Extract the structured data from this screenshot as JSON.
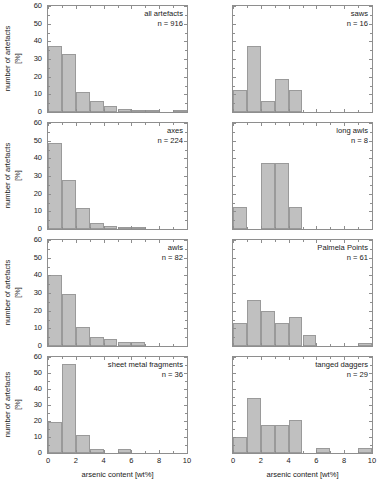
{
  "figure": {
    "width": 382,
    "height": 494,
    "bar_fill": "#c0c0c0",
    "bar_stroke": "#9a9a9a",
    "axis_color": "#8e8e8e",
    "xlabel": "arsenic content [wt%]",
    "ylabel": "number of artefacts",
    "ylabel_units": "[%]",
    "xticks": [
      "0",
      "2",
      "4",
      "6",
      "8",
      "10"
    ],
    "yticks_main": [
      "0",
      "10",
      "20",
      "30",
      "40",
      "50",
      "60"
    ]
  },
  "chart_data": [
    {
      "type": "bar",
      "panel": "top-left",
      "title": "all artefacts",
      "n_label": "n = 916",
      "n": 916,
      "xlabel": "arsenic content [wt%]",
      "ylabel": "number of artefacts [%]",
      "xlim": [
        0,
        10
      ],
      "ylim": [
        0,
        60
      ],
      "bin_width": 1,
      "bin_edges": [
        0,
        1,
        2,
        3,
        4,
        5,
        6,
        7,
        8,
        9,
        10
      ],
      "categories": [
        "0-1",
        "1-2",
        "2-3",
        "3-4",
        "4-5",
        "5-6",
        "6-7",
        "7-8",
        "8-9",
        "9-10"
      ],
      "values": [
        37.5,
        33,
        11.5,
        6,
        3.5,
        1.8,
        1,
        0.8,
        0,
        0.8
      ],
      "grid": false,
      "legend": "none"
    },
    {
      "type": "bar",
      "panel": "top-right",
      "title": "saws",
      "n_label": "n = 16",
      "n": 16,
      "xlabel": "arsenic content [wt%]",
      "ylabel": "number of artefacts [%]",
      "xlim": [
        0,
        10
      ],
      "ylim": [
        0,
        60
      ],
      "bin_width": 1,
      "bin_edges": [
        0,
        1,
        2,
        3,
        4,
        5,
        6,
        7,
        8,
        9,
        10
      ],
      "categories": [
        "0-1",
        "1-2",
        "2-3",
        "3-4",
        "4-5",
        "5-6",
        "6-7",
        "7-8",
        "8-9",
        "9-10"
      ],
      "values": [
        12.5,
        37.5,
        6.25,
        18.75,
        12.5,
        0,
        0,
        0,
        0,
        0
      ],
      "grid": false,
      "legend": "none"
    },
    {
      "type": "bar",
      "panel": "second-left",
      "title": "axes",
      "n_label": "n = 224",
      "n": 224,
      "xlabel": "arsenic content [wt%]",
      "ylabel": "number of artefacts [%]",
      "xlim": [
        0,
        10
      ],
      "ylim": [
        0,
        60
      ],
      "bin_width": 1,
      "bin_edges": [
        0,
        1,
        2,
        3,
        4,
        5,
        6,
        7,
        8,
        9,
        10
      ],
      "categories": [
        "0-1",
        "1-2",
        "2-3",
        "3-4",
        "4-5",
        "5-6",
        "6-7",
        "7-8",
        "8-9",
        "9-10"
      ],
      "values": [
        48.5,
        28,
        11.8,
        3.5,
        1.8,
        1,
        1,
        0,
        0,
        0
      ],
      "grid": false,
      "legend": "none"
    },
    {
      "type": "bar",
      "panel": "second-right",
      "title": "long awls",
      "n_label": "n = 8",
      "n": 8,
      "xlabel": "arsenic content [wt%]",
      "ylabel": "number of artefacts [%]",
      "xlim": [
        0,
        10
      ],
      "ylim": [
        0,
        60
      ],
      "bin_width": 1,
      "bin_edges": [
        0,
        1,
        2,
        3,
        4,
        5,
        6,
        7,
        8,
        9,
        10
      ],
      "categories": [
        "0-1",
        "1-2",
        "2-3",
        "3-4",
        "4-5",
        "5-6",
        "6-7",
        "7-8",
        "8-9",
        "9-10"
      ],
      "values": [
        12.5,
        0,
        37.5,
        37.5,
        12.5,
        0,
        0,
        0,
        0,
        0
      ],
      "grid": false,
      "legend": "none"
    },
    {
      "type": "bar",
      "panel": "third-left",
      "title": "awls",
      "n_label": "n = 82",
      "n": 82,
      "xlabel": "arsenic content [wt%]",
      "ylabel": "number of artefacts [%]",
      "xlim": [
        0,
        10
      ],
      "ylim": [
        0,
        60
      ],
      "bin_width": 1,
      "bin_edges": [
        0,
        1,
        2,
        3,
        4,
        5,
        6,
        7,
        8,
        9,
        10
      ],
      "categories": [
        "0-1",
        "1-2",
        "2-3",
        "3-4",
        "4-5",
        "5-6",
        "6-7",
        "7-8",
        "8-9",
        "9-10"
      ],
      "values": [
        40.2,
        29.3,
        11,
        5,
        4,
        2,
        2,
        0,
        0,
        0
      ],
      "grid": false,
      "legend": "none"
    },
    {
      "type": "bar",
      "panel": "third-right",
      "title": "Palmela Points",
      "n_label": "n = 61",
      "n": 61,
      "xlabel": "arsenic content [wt%]",
      "ylabel": "number of artefacts [%]",
      "xlim": [
        0,
        10
      ],
      "ylim": [
        0,
        60
      ],
      "bin_width": 1,
      "bin_edges": [
        0,
        1,
        2,
        3,
        4,
        5,
        6,
        7,
        8,
        9,
        10
      ],
      "categories": [
        "0-1",
        "1-2",
        "2-3",
        "3-4",
        "4-5",
        "5-6",
        "6-7",
        "7-8",
        "8-9",
        "9-10"
      ],
      "values": [
        13.1,
        26.2,
        19.7,
        13.1,
        16.4,
        6.5,
        0,
        0,
        0,
        1.6
      ],
      "grid": false,
      "legend": "none"
    },
    {
      "type": "bar",
      "panel": "bottom-left",
      "title": "sheet metal fragments",
      "n_label": "n = 36",
      "n": 36,
      "xlabel": "arsenic content [wt%]",
      "ylabel": "number of artefacts [%]",
      "xlim": [
        0,
        10
      ],
      "ylim": [
        0,
        60
      ],
      "bin_width": 1,
      "bin_edges": [
        0,
        1,
        2,
        3,
        4,
        5,
        6,
        7,
        8,
        9,
        10
      ],
      "categories": [
        "0-1",
        "1-2",
        "2-3",
        "3-4",
        "4-5",
        "5-6",
        "6-7",
        "7-8",
        "8-9",
        "9-10"
      ],
      "values": [
        19.4,
        55.6,
        11.1,
        2.8,
        0,
        2.8,
        0,
        0,
        0,
        0
      ],
      "grid": false,
      "legend": "none"
    },
    {
      "type": "bar",
      "panel": "bottom-right",
      "title": "tanged daggers",
      "n_label": "n = 29",
      "n": 29,
      "xlabel": "arsenic content [wt%]",
      "ylabel": "number of artefacts [%]",
      "xlim": [
        0,
        10
      ],
      "ylim": [
        0,
        60
      ],
      "bin_width": 1,
      "bin_edges": [
        0,
        1,
        2,
        3,
        4,
        5,
        6,
        7,
        8,
        9,
        10
      ],
      "categories": [
        "0-1",
        "1-2",
        "2-3",
        "3-4",
        "4-5",
        "5-6",
        "6-7",
        "7-8",
        "8-9",
        "9-10"
      ],
      "values": [
        10.3,
        34.5,
        17.2,
        17.2,
        20.7,
        0,
        3.4,
        0,
        0,
        3.4
      ],
      "grid": false,
      "legend": "none"
    }
  ]
}
